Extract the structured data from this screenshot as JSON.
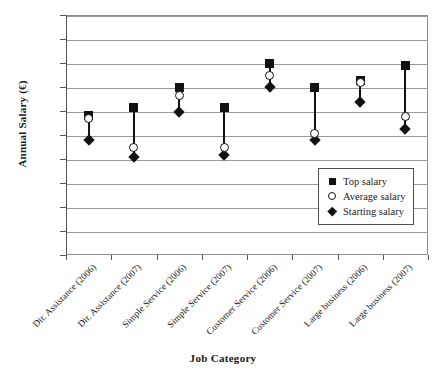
{
  "chart_data": {
    "type": "scatter",
    "title": "",
    "xlabel": "Job Category",
    "ylabel": "Annual Salary (€)",
    "ylim": [
      0,
      50000
    ],
    "yticks": [
      "0",
      "5,000",
      "10,000",
      "15,000",
      "20,000",
      "25,000",
      "30,000",
      "35,000",
      "40,000",
      "45,000",
      "50,000"
    ],
    "ytick_values": [
      0,
      5000,
      10000,
      15000,
      20000,
      25000,
      30000,
      35000,
      40000,
      45000,
      50000
    ],
    "grid": true,
    "legend_position": "inside-bottom-right",
    "categories": [
      "Dir. Assistance (2006)",
      "Dir. Assistance (2007)",
      "Simple Service (2006)",
      "Simple Service (2007)",
      "Customer Service (2006)",
      "Customer Service (2007)",
      "Large business (2006)",
      "Large business (2007)"
    ],
    "series": [
      {
        "name": "Top salary",
        "marker": "filled-square",
        "values": [
          29000,
          30700,
          35000,
          30700,
          40000,
          35000,
          36300,
          39500
        ]
      },
      {
        "name": "Average salary",
        "marker": "open-circle",
        "values": [
          28500,
          22500,
          33200,
          22300,
          37500,
          25400,
          36000,
          28800
        ]
      },
      {
        "name": "Starting salary",
        "marker": "filled-diamond",
        "values": [
          24000,
          20400,
          29800,
          20800,
          35000,
          24000,
          31800,
          26200
        ]
      }
    ]
  },
  "legend": {
    "items": [
      {
        "label": "Top salary",
        "marker": "filled-square"
      },
      {
        "label": "Average salary",
        "marker": "open-circle"
      },
      {
        "label": "Starting salary",
        "marker": "filled-diamond"
      }
    ]
  }
}
